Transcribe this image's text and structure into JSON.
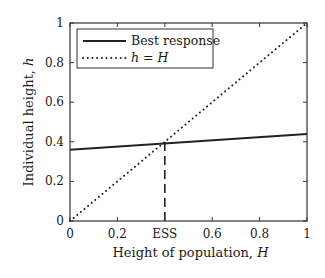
{
  "chart_data": {
    "type": "line",
    "title": "",
    "xlabel": "Height of population, H",
    "ylabel": "Individual height, h",
    "xlim": [
      0,
      1
    ],
    "ylim": [
      0,
      1
    ],
    "grid": false,
    "legend_position": "upper left",
    "x_ticks": [
      0,
      0.2,
      0.4,
      0.6,
      0.8,
      1
    ],
    "x_tick_labels": [
      "0",
      "0.2",
      "ESS",
      "0.6",
      "0.8",
      "1"
    ],
    "y_ticks": [
      0,
      0.2,
      0.4,
      0.6,
      0.8,
      1
    ],
    "y_tick_labels": [
      "0",
      "0.2",
      "0.4",
      "0.6",
      "0.8",
      "1"
    ],
    "series": [
      {
        "name": "Best response",
        "style": "solid",
        "color": "#222222",
        "x": [
          0,
          1
        ],
        "y": [
          0.36,
          0.44
        ]
      },
      {
        "name": "h = H",
        "style": "dotted",
        "color": "#222222",
        "x": [
          0,
          1
        ],
        "y": [
          0,
          1
        ]
      }
    ],
    "annotations": [
      {
        "type": "vertical-dashed-line",
        "x": 0.4,
        "y_from": 0,
        "y_to": 0.4,
        "label": "ESS"
      }
    ]
  },
  "legend": {
    "items": [
      {
        "label": "Best response",
        "style": "solid"
      },
      {
        "label": "h = H",
        "style": "dotted"
      }
    ]
  },
  "axes": {
    "xlabel_prefix": "Height of population, ",
    "xlabel_var": "H",
    "ylabel_prefix": "Individual height, ",
    "ylabel_var": "h"
  }
}
